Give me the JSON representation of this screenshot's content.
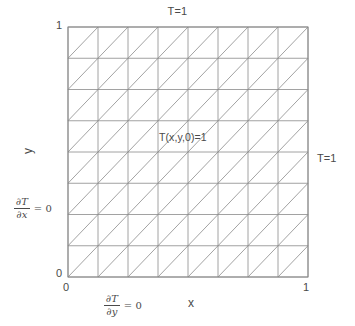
{
  "figure": {
    "title": "",
    "domain": {
      "x_range": [
        0,
        1
      ],
      "y_range": [
        0,
        1
      ]
    },
    "axes": {
      "x_label": "x",
      "y_label": "y",
      "x_ticks": [
        "0",
        "1"
      ],
      "y_ticks": [
        "0",
        "1"
      ]
    },
    "mesh": {
      "type": "triangular",
      "divisions_x": 8,
      "divisions_y": 8,
      "diagonal_direction": "bottom-left-to-top-right",
      "line_color": "#8a8a8a",
      "border_color": "#8a8a8a"
    },
    "boundary_conditions": {
      "top": "T=1",
      "right": "T=1",
      "left_numerator": "∂T",
      "left_denominator": "∂x",
      "left_equals": "= 0",
      "bottom_numerator": "∂T",
      "bottom_denominator": "∂y",
      "bottom_equals": "= 0"
    },
    "initial_condition": "T(x,y,0)=1",
    "colors": {
      "background": "#ffffff",
      "line": "#8a8a8a",
      "text": "#4a4a4a"
    }
  }
}
